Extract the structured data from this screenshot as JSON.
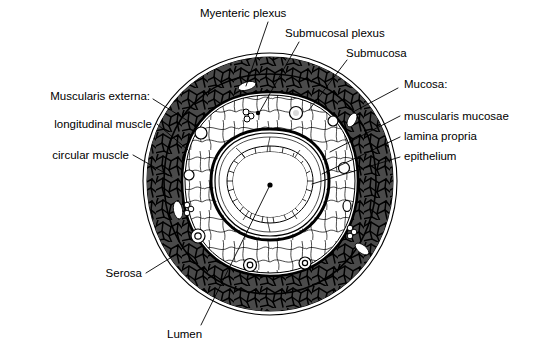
{
  "figure": {
    "kind": "anatomical-cross-section",
    "style": "black-and-white line drawing with stippled and mosaic shading",
    "background_color": "#ffffff",
    "ink_color": "#000000",
    "muscle_fill_color": "#4a4a4a"
  },
  "labels": {
    "myenteric_plexus": "Myenteric plexus",
    "submucosal_plexus": "Submucosal plexus",
    "submucosa": "Submucosa",
    "mucosa_heading": "Mucosa:",
    "muscularis_mucosae": "muscularis mucosae",
    "lamina_propria": "lamina propria",
    "epithelium": "epithelium",
    "muscularis_externa_heading": "Muscularis externa:",
    "longitudinal_muscle": "longitudinal muscle",
    "circular_muscle": "circular muscle",
    "serosa": "Serosa",
    "lumen": "Lumen"
  },
  "layers": [
    {
      "name": "Serosa",
      "position": "outermost",
      "appearance": "thin smooth outer membrane line"
    },
    {
      "name": "Longitudinal muscle",
      "position": "outer",
      "appearance": "dark mosaic band, fibres cut in cross section"
    },
    {
      "name": "Circular muscle",
      "position": "outer",
      "appearance": "dark mosaic band inside longitudinal layer"
    },
    {
      "name": "Myenteric plexus",
      "position": "between muscle layers",
      "appearance": "small ganglion cluster between longitudinal and circular muscle"
    },
    {
      "name": "Submucosa",
      "position": "middle",
      "appearance": "pale connective tissue with blood vessels"
    },
    {
      "name": "Submucosal plexus",
      "position": "in submucosa",
      "appearance": "small ganglion cluster within submucosa"
    },
    {
      "name": "Muscularis mucosae",
      "position": "inner",
      "appearance": "thin dark muscle band bounding the mucosa"
    },
    {
      "name": "Lamina propria",
      "position": "inner",
      "appearance": "loose connective tissue beneath epithelium"
    },
    {
      "name": "Epithelium",
      "position": "innermost",
      "appearance": "beaded cell layer lining the lumen"
    },
    {
      "name": "Lumen",
      "position": "center",
      "appearance": "open central cavity"
    }
  ]
}
